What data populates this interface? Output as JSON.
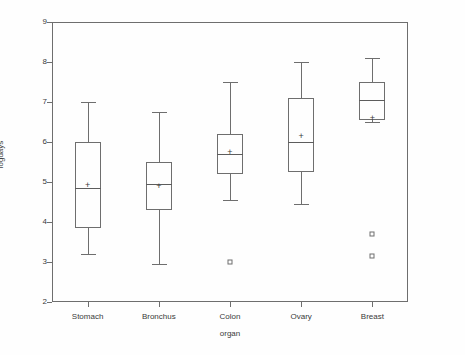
{
  "chart_data": {
    "type": "box",
    "title": "",
    "xlabel": "organ",
    "ylabel": "logdays",
    "categories": [
      "Stomach",
      "Bronchus",
      "Colon",
      "Ovary",
      "Breast"
    ],
    "ylim": [
      2,
      9
    ],
    "yticks": [
      2,
      3,
      4,
      5,
      6,
      7,
      8,
      9
    ],
    "ytick_labels": [
      "2",
      "3",
      "4",
      "5",
      "6",
      "7",
      "8",
      "9"
    ],
    "grid": false,
    "legend": null,
    "mean_marker": "+",
    "outlier_marker": "square",
    "boxes": [
      {
        "category": "Stomach",
        "whisker_low": 3.2,
        "q1": 3.85,
        "median": 4.85,
        "q3": 6.0,
        "whisker_high": 7.0,
        "mean": 4.92,
        "outliers": []
      },
      {
        "category": "Bronchus",
        "whisker_low": 2.95,
        "q1": 4.3,
        "median": 4.95,
        "q3": 5.5,
        "whisker_high": 6.75,
        "mean": 4.9,
        "outliers": []
      },
      {
        "category": "Colon",
        "whisker_low": 4.55,
        "q1": 5.2,
        "median": 5.7,
        "q3": 6.2,
        "whisker_high": 7.5,
        "mean": 5.75,
        "outliers": [
          3.0
        ]
      },
      {
        "category": "Ovary",
        "whisker_low": 4.45,
        "q1": 5.25,
        "median": 6.0,
        "q3": 7.1,
        "whisker_high": 8.0,
        "mean": 6.15,
        "outliers": []
      },
      {
        "category": "Breast",
        "whisker_low": 6.5,
        "q1": 6.55,
        "median": 7.05,
        "q3": 7.5,
        "whisker_high": 8.1,
        "mean": 6.6,
        "outliers": [
          3.7,
          3.15
        ]
      }
    ]
  }
}
